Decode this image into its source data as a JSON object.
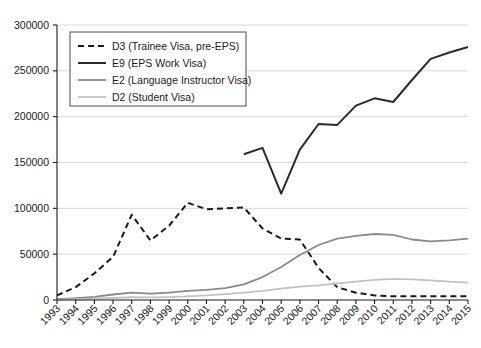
{
  "chart_data": {
    "type": "line",
    "title": "",
    "xlabel": "",
    "ylabel": "",
    "grid": true,
    "legend_position": "top-left",
    "x": [
      1993,
      1994,
      1995,
      1996,
      1997,
      1998,
      1999,
      2000,
      2001,
      2002,
      2003,
      2004,
      2005,
      2006,
      2007,
      2008,
      2009,
      2010,
      2011,
      2012,
      2013,
      2014,
      2015
    ],
    "xtick_labels": [
      "1993",
      "1994",
      "1995",
      "1996",
      "1997",
      "1998",
      "1999",
      "2000",
      "2001",
      "2002",
      "2003",
      "2004",
      "2005",
      "2006",
      "2007",
      "2008",
      "2009",
      "2010",
      "2011",
      "2012",
      "2013",
      "2014",
      "2015"
    ],
    "ytick_labels": [
      "0",
      "50000",
      "100000",
      "150000",
      "200000",
      "250000",
      "300000"
    ],
    "ytick_values": [
      0,
      50000,
      100000,
      150000,
      200000,
      250000,
      300000
    ],
    "ylim": [
      0,
      300000
    ],
    "xlim": [
      1993,
      2015
    ],
    "series": [
      {
        "name": "D3 (Trainee Visa, pre-EPS)",
        "key": "d3",
        "style": "dashed",
        "color": "#1a1a1a",
        "width": 2.0,
        "values": [
          5000,
          14000,
          29000,
          47000,
          93000,
          65000,
          81000,
          106000,
          99000,
          100000,
          101000,
          78000,
          67000,
          66000,
          35000,
          14000,
          8000,
          5000,
          4000,
          4000,
          4000,
          4000,
          4000
        ]
      },
      {
        "name": "E9 (EPS Work Visa)",
        "key": "e9",
        "style": "solid",
        "color": "#2b2b2b",
        "width": 2.0,
        "values": [
          null,
          null,
          null,
          null,
          null,
          null,
          null,
          null,
          null,
          null,
          159000,
          166000,
          116000,
          164000,
          192000,
          191000,
          212000,
          220000,
          216000,
          240000,
          263000,
          270000,
          276000
        ]
      },
      {
        "name": "E2 (Language Instructor Visa)",
        "key": "e2",
        "style": "solid",
        "color": "#8a8a8a",
        "width": 1.8,
        "values": [
          1000,
          2000,
          3500,
          6000,
          8000,
          7000,
          8000,
          10000,
          11000,
          13000,
          17000,
          25000,
          36000,
          49000,
          60000,
          67000,
          70000,
          72000,
          71000,
          66000,
          64000,
          65000,
          67000
        ]
      },
      {
        "name": "D2 (Student Visa)",
        "key": "d2",
        "style": "solid",
        "color": "#c2c2c2",
        "width": 1.8,
        "values": [
          500,
          900,
          1500,
          2200,
          3000,
          2800,
          3200,
          4000,
          5000,
          6500,
          8000,
          10000,
          12500,
          14500,
          16000,
          18000,
          20000,
          22000,
          23000,
          22500,
          21500,
          20000,
          19000
        ]
      }
    ]
  },
  "legend": {
    "entries": [
      {
        "label": "D3 (Trainee Visa, pre-EPS)"
      },
      {
        "label": "E9 (EPS Work Visa)"
      },
      {
        "label": "E2 (Language Instructor Visa)"
      },
      {
        "label": "D2 (Student Visa)"
      }
    ]
  },
  "colors": {
    "axis": "#1a1a1a",
    "grid": "#d8d8d8",
    "background": "#ffffff",
    "d3": "#1a1a1a",
    "e9": "#2b2b2b",
    "e2": "#8a8a8a",
    "d2": "#c2c2c2"
  }
}
